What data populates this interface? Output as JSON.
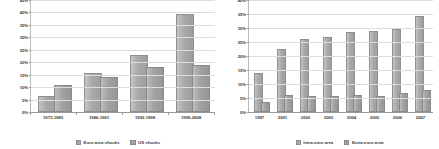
{
  "chart_data": [
    {
      "type": "bar",
      "id": "shocks-by-period",
      "title": "",
      "xlabel": "",
      "ylabel": "",
      "ylim": [
        0,
        45
      ],
      "ytick_step": 5,
      "ytick_labels": [
        "0%",
        "5%",
        "10%",
        "15%",
        "20%",
        "25%",
        "30%",
        "35%",
        "40%",
        "45%"
      ],
      "grid": true,
      "legend_position": "bottom",
      "categories": [
        "1973-1985",
        "1986-1991",
        "1992-1998",
        "1999-2008"
      ],
      "series": [
        {
          "name": "Euro area shocks",
          "values": [
            5.6,
            14.8,
            22.2,
            38.5
          ]
        },
        {
          "name": "US shocks",
          "values": [
            10.2,
            13.2,
            17.3,
            18.0
          ]
        }
      ]
    },
    {
      "type": "bar",
      "id": "euro-area-trade",
      "title": "",
      "xlabel": "",
      "ylabel": "",
      "ylim": [
        0,
        40
      ],
      "ytick_step": 5,
      "ytick_labels": [
        "0%",
        "5%",
        "10%",
        "15%",
        "20%",
        "25%",
        "30%",
        "35%",
        "40%"
      ],
      "grid": true,
      "legend_position": "bottom",
      "categories": [
        "1997",
        "2001",
        "2002",
        "2003",
        "2004",
        "2005",
        "2006",
        "2007"
      ],
      "series": [
        {
          "name": "Intra-euro area",
          "values": [
            13.1,
            21.9,
            25.4,
            26.1,
            27.9,
            28.3,
            28.9,
            33.4
          ]
        },
        {
          "name": "Extra-euro area",
          "values": [
            2.9,
            5.2,
            4.9,
            5.0,
            5.3,
            5.1,
            6.2,
            7.0
          ]
        }
      ]
    }
  ],
  "colors": {
    "series_1": "#a8a8a8",
    "series_2": "#a0a0a0",
    "gridline": "#dcdcdc",
    "axis": "#9a9a9a",
    "text": "#3c3c3c",
    "background": "#ffffff"
  }
}
